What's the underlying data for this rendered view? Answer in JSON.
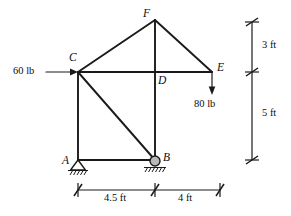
{
  "figure": {
    "units": "ft",
    "joint_labels": {
      "A": "A",
      "B": "B",
      "C": "C",
      "D": "D",
      "E": "E",
      "F": "F"
    },
    "loads": [
      {
        "name": "horizontal-load-at-C",
        "label": "60 lb",
        "magnitude": 60,
        "unit": "lb",
        "direction": "right",
        "applied_at": "C"
      },
      {
        "name": "vertical-load-at-E",
        "label": "80 lb",
        "magnitude": 80,
        "unit": "lb",
        "direction": "down",
        "applied_at": "E"
      }
    ],
    "dimensions": [
      {
        "name": "span-A-to-B",
        "label": "4.5 ft",
        "value": 4.5,
        "unit": "ft",
        "orientation": "horizontal"
      },
      {
        "name": "span-B-to-E",
        "label": "4 ft",
        "value": 4,
        "unit": "ft",
        "orientation": "horizontal"
      },
      {
        "name": "height-F-to-E",
        "label": "3 ft",
        "value": 3,
        "unit": "ft",
        "orientation": "vertical"
      },
      {
        "name": "height-E-to-base",
        "label": "5 ft",
        "value": 5,
        "unit": "ft",
        "orientation": "vertical"
      }
    ],
    "supports": [
      {
        "name": "pin-support-A",
        "type": "pin",
        "at": "A"
      },
      {
        "name": "roller-support-B",
        "type": "roller",
        "at": "B"
      }
    ],
    "members": [
      "A-C",
      "A-B",
      "C-B",
      "C-D",
      "D-E",
      "C-F",
      "F-E",
      "F-D",
      "D-B"
    ],
    "colors": {
      "line": "#1a1a1a",
      "roller": "#b9b9b9",
      "background": "#ffffff"
    }
  }
}
